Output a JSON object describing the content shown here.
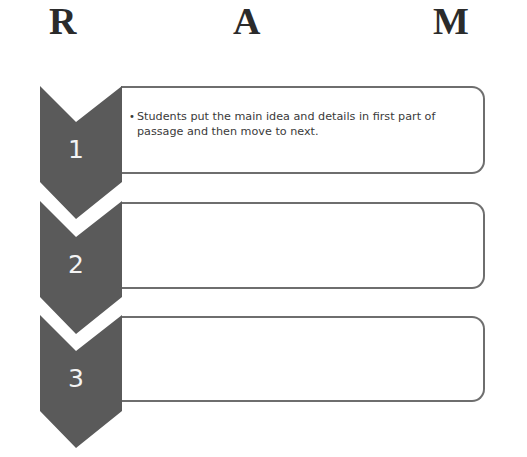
{
  "header": {
    "letters": [
      "R",
      "A",
      "M"
    ]
  },
  "colors": {
    "chevron_fill": "#5a5a5a",
    "box_border": "#6e6e6e",
    "letter": "#2b2b2b",
    "number": "#f4f4f4",
    "text": "#3a3a3a"
  },
  "steps": [
    {
      "number": "1",
      "bullet": "•",
      "text": "Students put the main idea and details in first part of passage and then move to next."
    },
    {
      "number": "2",
      "bullet": "",
      "text": ""
    },
    {
      "number": "3",
      "bullet": "",
      "text": ""
    }
  ]
}
